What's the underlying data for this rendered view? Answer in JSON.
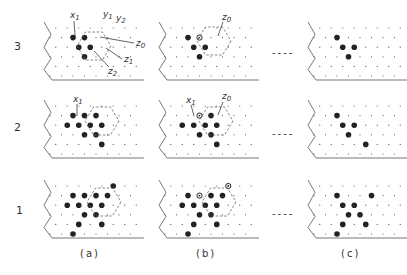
{
  "figure": {
    "row_labels": [
      "3",
      "2",
      "1"
    ],
    "column_labels": [
      "(a)",
      "(b)",
      "(c)"
    ],
    "ellipsis": "----",
    "colors": {
      "ink": "#222222",
      "lattice": "#555555",
      "hex": "#666666",
      "background": "#ffffff"
    },
    "lattice": {
      "rows": 6,
      "cols": 8,
      "dx": 11.5,
      "dy": 9.6
    },
    "panels": [
      {
        "id": "3a",
        "row": "3",
        "col": "(a)",
        "x0": 50,
        "y0": 28,
        "filled": [
          [
            1,
            2
          ],
          [
            1,
            3
          ],
          [
            2,
            2
          ],
          [
            2,
            3
          ],
          [
            3,
            3
          ]
        ],
        "hollow": [],
        "hexagon": {
          "cx": 94,
          "cy": 46,
          "r": 17
        },
        "annotations": [
          {
            "text": "x1",
            "x": 70,
            "y": 18,
            "lx1": 74,
            "ly1": 21,
            "lx2": 75,
            "ly2": 36
          },
          {
            "text": "y1",
            "x": 103,
            "y": 17
          },
          {
            "text": "y2",
            "x": 116,
            "y": 21
          },
          {
            "text": "z0",
            "x": 136,
            "y": 46,
            "lx1": 134,
            "ly1": 43,
            "lx2": 100,
            "ly2": 37
          },
          {
            "text": "z1",
            "x": 124,
            "y": 62,
            "lx1": 122,
            "ly1": 59,
            "lx2": 106,
            "ly2": 48
          },
          {
            "text": "z2",
            "x": 108,
            "y": 74,
            "lx1": 109,
            "ly1": 67,
            "lx2": 94,
            "ly2": 51
          }
        ]
      },
      {
        "id": "3b",
        "row": "3",
        "col": "(b)",
        "x0": 165,
        "y0": 28,
        "filled": [
          [
            1,
            2
          ],
          [
            2,
            2
          ],
          [
            2,
            3
          ],
          [
            3,
            3
          ]
        ],
        "hollow": [
          [
            1,
            3
          ]
        ],
        "hexagon": {
          "cx": 214,
          "cy": 41,
          "r": 17
        },
        "annotations": [
          {
            "text": "z0",
            "x": 222,
            "y": 20,
            "lx1": 223,
            "ly1": 22,
            "lx2": 218,
            "ly2": 36
          }
        ]
      },
      {
        "id": "3c",
        "row": "3",
        "col": "(c)",
        "x0": 314,
        "y0": 28,
        "filled": [
          [
            1,
            2
          ],
          [
            2,
            2
          ],
          [
            2,
            3
          ],
          [
            3,
            3
          ]
        ],
        "hollow": [],
        "hexagon": null,
        "annotations": []
      },
      {
        "id": "2a",
        "row": "2",
        "col": "(a)",
        "x0": 50,
        "y0": 106,
        "filled": [
          [
            1,
            2
          ],
          [
            1,
            3
          ],
          [
            1,
            4
          ],
          [
            2,
            1
          ],
          [
            2,
            2
          ],
          [
            2,
            3
          ],
          [
            2,
            4
          ],
          [
            3,
            3
          ],
          [
            3,
            4
          ],
          [
            4,
            4
          ]
        ],
        "hollow": [],
        "hexagon": {
          "cx": 102,
          "cy": 121,
          "r": 17
        },
        "annotations": [
          {
            "text": "x1",
            "x": 73,
            "y": 102,
            "lx1": 77,
            "ly1": 104,
            "lx2": 77,
            "ly2": 116
          }
        ]
      },
      {
        "id": "2b",
        "row": "2",
        "col": "(b)",
        "x0": 165,
        "y0": 106,
        "filled": [
          [
            1,
            4
          ],
          [
            2,
            1
          ],
          [
            2,
            2
          ],
          [
            2,
            3
          ],
          [
            2,
            4
          ],
          [
            3,
            3
          ],
          [
            3,
            4
          ],
          [
            4,
            4
          ]
        ],
        "hollow": [
          [
            1,
            3
          ]
        ],
        "hexagon": {
          "cx": 216,
          "cy": 121,
          "r": 17
        },
        "annotations": [
          {
            "text": "x1",
            "x": 186,
            "y": 103,
            "lx1": 191,
            "ly1": 105,
            "lx2": 194,
            "ly2": 116
          },
          {
            "text": "z0",
            "x": 222,
            "y": 99,
            "lx1": 223,
            "ly1": 102,
            "lx2": 218,
            "ly2": 115
          }
        ]
      },
      {
        "id": "2c",
        "row": "2",
        "col": "(c)",
        "x0": 314,
        "y0": 106,
        "filled": [
          [
            1,
            2
          ],
          [
            2,
            2
          ],
          [
            2,
            3
          ],
          [
            3,
            3
          ],
          [
            4,
            4
          ]
        ],
        "hollow": [],
        "hexagon": null,
        "annotations": []
      },
      {
        "id": "1a",
        "row": "1",
        "col": "(a)",
        "x0": 50,
        "y0": 186,
        "filled": [
          [
            0,
            5
          ],
          [
            1,
            2
          ],
          [
            1,
            3
          ],
          [
            1,
            4
          ],
          [
            1,
            5
          ],
          [
            2,
            1
          ],
          [
            2,
            2
          ],
          [
            2,
            3
          ],
          [
            2,
            4
          ],
          [
            3,
            3
          ],
          [
            3,
            4
          ],
          [
            4,
            2
          ],
          [
            4,
            4
          ],
          [
            5,
            2
          ]
        ],
        "hollow": [],
        "hexagon": {
          "cx": 104,
          "cy": 202,
          "r": 17
        },
        "annotations": []
      },
      {
        "id": "1b",
        "row": "1",
        "col": "(b)",
        "x0": 165,
        "y0": 186,
        "filled": [
          [
            1,
            2
          ],
          [
            1,
            4
          ],
          [
            1,
            5
          ],
          [
            2,
            1
          ],
          [
            2,
            2
          ],
          [
            2,
            3
          ],
          [
            2,
            4
          ],
          [
            3,
            3
          ],
          [
            3,
            4
          ],
          [
            4,
            2
          ],
          [
            4,
            4
          ],
          [
            5,
            2
          ]
        ],
        "hollow": [
          [
            0,
            5
          ],
          [
            1,
            3
          ]
        ],
        "hexagon": {
          "cx": 219,
          "cy": 202,
          "r": 17
        },
        "annotations": []
      },
      {
        "id": "1c",
        "row": "1",
        "col": "(c)",
        "x0": 314,
        "y0": 186,
        "filled": [
          [
            1,
            2
          ],
          [
            1,
            5
          ],
          [
            2,
            2
          ],
          [
            2,
            3
          ],
          [
            3,
            3
          ],
          [
            3,
            4
          ],
          [
            4,
            2
          ],
          [
            4,
            4
          ],
          [
            5,
            2
          ]
        ],
        "hollow": [],
        "hexagon": null,
        "annotations": []
      }
    ]
  }
}
